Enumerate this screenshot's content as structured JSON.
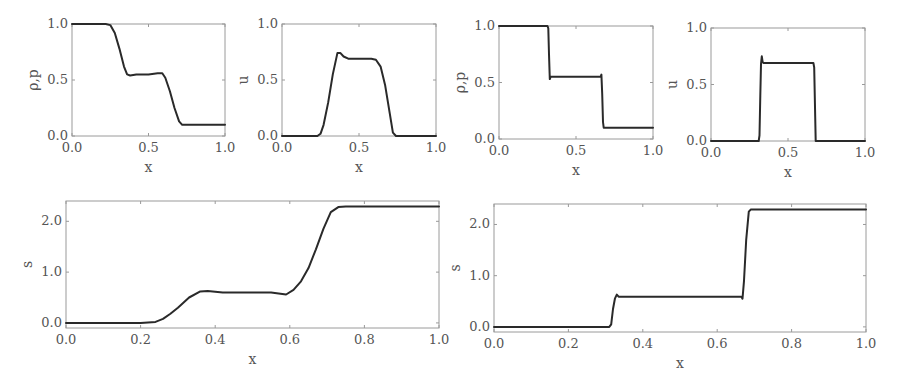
{
  "figure": {
    "line_color": "#2a2a2a",
    "frame_color": "#9a9a9a",
    "text_color": "#555555"
  },
  "chart_data": [
    {
      "id": "top-left-density",
      "type": "line",
      "title": "",
      "xlabel": "x",
      "ylabel": "ρ,p",
      "xlim": [
        0.0,
        1.0
      ],
      "ylim": [
        0.0,
        1.0
      ],
      "xticks": [
        0.0,
        0.5,
        1.0
      ],
      "xtick_labels": [
        "0.0",
        "0.5",
        "1.0"
      ],
      "yticks": [
        0.0,
        0.5,
        1.0
      ],
      "ytick_labels": [
        "0.0",
        "0.5",
        "1.0"
      ],
      "grid": false,
      "box": {
        "left": 72,
        "top": 24,
        "right": 225,
        "bottom": 136
      },
      "series": [
        {
          "name": "rho,p",
          "x": [
            0.0,
            0.22,
            0.25,
            0.28,
            0.31,
            0.34,
            0.36,
            0.38,
            0.42,
            0.5,
            0.56,
            0.59,
            0.61,
            0.64,
            0.67,
            0.7,
            0.72,
            0.75,
            1.0
          ],
          "y": [
            1.0,
            1.0,
            0.99,
            0.92,
            0.78,
            0.62,
            0.55,
            0.54,
            0.55,
            0.55,
            0.56,
            0.56,
            0.52,
            0.4,
            0.25,
            0.13,
            0.1,
            0.1,
            0.1
          ]
        }
      ]
    },
    {
      "id": "top-left-velocity",
      "type": "line",
      "title": "",
      "xlabel": "x",
      "ylabel": "u",
      "xlim": [
        0.0,
        1.0
      ],
      "ylim": [
        0.0,
        1.0
      ],
      "xticks": [
        0.0,
        0.5,
        1.0
      ],
      "xtick_labels": [
        "0.0",
        "0.5",
        "1.0"
      ],
      "yticks": [
        0.0,
        0.5,
        1.0
      ],
      "ytick_labels": [
        "0.0",
        "0.5",
        "1.0"
      ],
      "grid": false,
      "box": {
        "left": 282,
        "top": 24,
        "right": 436,
        "bottom": 136
      },
      "series": [
        {
          "name": "u",
          "x": [
            0.0,
            0.23,
            0.25,
            0.27,
            0.3,
            0.33,
            0.36,
            0.38,
            0.4,
            0.43,
            0.5,
            0.58,
            0.61,
            0.64,
            0.67,
            0.7,
            0.72,
            0.74,
            1.0
          ],
          "y": [
            0.0,
            0.0,
            0.02,
            0.1,
            0.3,
            0.55,
            0.74,
            0.74,
            0.71,
            0.69,
            0.69,
            0.69,
            0.68,
            0.62,
            0.45,
            0.2,
            0.03,
            0.0,
            0.0
          ]
        }
      ]
    },
    {
      "id": "top-right-density",
      "type": "line",
      "title": "",
      "xlabel": "x",
      "ylabel": "ρ,p",
      "xlim": [
        0.0,
        1.0
      ],
      "ylim": [
        0.0,
        1.0
      ],
      "xticks": [
        0.0,
        0.5,
        1.0
      ],
      "xtick_labels": [
        "0.0",
        "0.5",
        "1.0"
      ],
      "yticks": [
        0.0,
        0.5,
        1.0
      ],
      "ytick_labels": [
        "0.0",
        "0.5",
        "1.0"
      ],
      "grid": false,
      "box": {
        "left": 499,
        "top": 26,
        "right": 653,
        "bottom": 139
      },
      "series": [
        {
          "name": "rho,p",
          "x": [
            0.0,
            0.315,
            0.32,
            0.325,
            0.33,
            0.335,
            0.5,
            0.66,
            0.665,
            0.67,
            0.675,
            0.68,
            1.0
          ],
          "y": [
            1.0,
            1.0,
            0.98,
            0.75,
            0.53,
            0.55,
            0.55,
            0.55,
            0.57,
            0.4,
            0.15,
            0.1,
            0.1
          ]
        }
      ]
    },
    {
      "id": "top-right-velocity",
      "type": "line",
      "title": "",
      "xlabel": "x",
      "ylabel": "u",
      "xlim": [
        0.0,
        1.0
      ],
      "ylim": [
        0.0,
        1.0
      ],
      "xticks": [
        0.0,
        0.5,
        1.0
      ],
      "xtick_labels": [
        "0.0",
        "0.5",
        "1.0"
      ],
      "yticks": [
        0.0,
        0.5,
        1.0
      ],
      "ytick_labels": [
        "0.0",
        "0.5",
        "1.0"
      ],
      "grid": false,
      "box": {
        "left": 711,
        "top": 28,
        "right": 865,
        "bottom": 141
      },
      "series": [
        {
          "name": "u",
          "x": [
            0.0,
            0.31,
            0.315,
            0.32,
            0.325,
            0.33,
            0.335,
            0.34,
            0.5,
            0.665,
            0.67,
            0.675,
            0.68,
            1.0
          ],
          "y": [
            0.0,
            0.0,
            0.05,
            0.4,
            0.68,
            0.75,
            0.7,
            0.69,
            0.69,
            0.69,
            0.65,
            0.3,
            0.0,
            0.0
          ]
        }
      ]
    },
    {
      "id": "bottom-left-entropy",
      "type": "line",
      "title": "",
      "xlabel": "x",
      "ylabel": "s",
      "xlim": [
        0.0,
        1.0
      ],
      "ylim": [
        -0.1,
        2.4
      ],
      "xticks": [
        0.0,
        0.2,
        0.4,
        0.6,
        0.8,
        1.0
      ],
      "xtick_labels": [
        "0.0",
        "0.2",
        "0.4",
        "0.6",
        "0.8",
        "1.0"
      ],
      "yticks": [
        0.0,
        1.0,
        2.0
      ],
      "ytick_labels": [
        "0.0",
        "1.0",
        "2.0"
      ],
      "grid": false,
      "box": {
        "left": 66,
        "top": 201,
        "right": 439,
        "bottom": 328
      },
      "series": [
        {
          "name": "s",
          "x": [
            0.0,
            0.2,
            0.24,
            0.26,
            0.28,
            0.3,
            0.33,
            0.36,
            0.38,
            0.42,
            0.5,
            0.55,
            0.59,
            0.61,
            0.63,
            0.65,
            0.67,
            0.69,
            0.71,
            0.73,
            0.75,
            1.0
          ],
          "y": [
            0.0,
            0.0,
            0.02,
            0.08,
            0.18,
            0.3,
            0.5,
            0.62,
            0.63,
            0.6,
            0.6,
            0.6,
            0.56,
            0.65,
            0.82,
            1.08,
            1.45,
            1.85,
            2.18,
            2.28,
            2.29,
            2.29
          ]
        }
      ]
    },
    {
      "id": "bottom-right-entropy",
      "type": "line",
      "title": "",
      "xlabel": "x",
      "ylabel": "s",
      "xlim": [
        0.0,
        1.0
      ],
      "ylim": [
        -0.1,
        2.4
      ],
      "xticks": [
        0.0,
        0.2,
        0.4,
        0.6,
        0.8,
        1.0
      ],
      "xtick_labels": [
        "0.0",
        "0.2",
        "0.4",
        "0.6",
        "0.8",
        "1.0"
      ],
      "yticks": [
        0.0,
        1.0,
        2.0
      ],
      "ytick_labels": [
        "0.0",
        "1.0",
        "2.0"
      ],
      "grid": false,
      "box": {
        "left": 494,
        "top": 204,
        "right": 866,
        "bottom": 332
      },
      "series": [
        {
          "name": "s",
          "x": [
            0.0,
            0.31,
            0.315,
            0.32,
            0.325,
            0.33,
            0.335,
            0.5,
            0.665,
            0.668,
            0.672,
            0.678,
            0.685,
            0.69,
            1.0
          ],
          "y": [
            0.0,
            0.0,
            0.05,
            0.35,
            0.55,
            0.63,
            0.59,
            0.59,
            0.59,
            0.55,
            0.9,
            1.7,
            2.25,
            2.29,
            2.29
          ]
        }
      ]
    }
  ]
}
